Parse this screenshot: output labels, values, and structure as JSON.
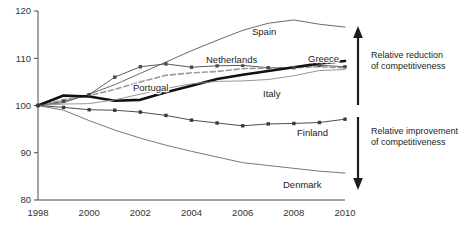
{
  "chart_data": {
    "type": "line",
    "title": "",
    "xlabel": "",
    "ylabel": "",
    "xlim": [
      1998,
      2010
    ],
    "ylim": [
      80,
      120
    ],
    "ytick_labels": [
      "80",
      "90",
      "100",
      "110",
      "120"
    ],
    "yticks": [
      80,
      90,
      100,
      110,
      120
    ],
    "xtick_labels": [
      "1998",
      "2000",
      "2002",
      "2004",
      "2006",
      "2008",
      "2010"
    ],
    "xticks": [
      1998,
      2000,
      2002,
      2004,
      2006,
      2008,
      2010
    ],
    "grid": false,
    "legend": "inline-labels",
    "x": [
      1998,
      1999,
      2000,
      2001,
      2002,
      2003,
      2004,
      2005,
      2006,
      2007,
      2008,
      2009,
      2010
    ],
    "series": [
      {
        "name": "Spain",
        "label": "Spain",
        "color": "#5a5a5a",
        "style": "thin-solid",
        "markers": false,
        "values": [
          100,
          100.6,
          102.4,
          104.4,
          106.8,
          109.2,
          111.6,
          113.8,
          115.9,
          117.4,
          118.1,
          117.2,
          116.6
        ]
      },
      {
        "name": "Netherlands",
        "label": "Netherlands",
        "color": "#4a4a4a",
        "style": "thin-solid",
        "markers": true,
        "values": [
          100,
          100.9,
          102.3,
          106.0,
          108.2,
          108.8,
          108.1,
          108.4,
          108.5,
          108.0,
          108.0,
          108.5,
          108.2
        ]
      },
      {
        "name": "Portugal",
        "label": "Portugal",
        "color": "#9a9a9a",
        "style": "dashed",
        "markers": false,
        "values": [
          100,
          101.2,
          102.1,
          103.4,
          105.0,
          106.4,
          106.9,
          107.2,
          107.8,
          107.9,
          108.0,
          108.2,
          108.0
        ]
      },
      {
        "name": "Greece",
        "label": "Greece",
        "color": "#111111",
        "style": "thick-solid",
        "markers": false,
        "values": [
          100,
          102.1,
          101.9,
          101.0,
          101.2,
          102.8,
          104.2,
          105.6,
          106.5,
          107.3,
          108.1,
          108.9,
          109.4
        ]
      },
      {
        "name": "Italy",
        "label": "Italy",
        "color": "#8a8a8a",
        "style": "thin-solid",
        "markers": false,
        "values": [
          100,
          100.3,
          100.4,
          101.2,
          102.4,
          103.6,
          104.6,
          105.1,
          105.2,
          105.5,
          106.3,
          107.4,
          107.6
        ]
      },
      {
        "name": "Finland",
        "label": "Finland",
        "color": "#3a3a3a",
        "style": "thin-solid",
        "markers": true,
        "values": [
          100,
          99.6,
          99.1,
          99.0,
          98.6,
          97.9,
          96.9,
          96.3,
          95.7,
          96.1,
          96.2,
          96.4,
          97.1
        ]
      },
      {
        "name": "Denmark",
        "label": "Denmark",
        "color": "#6a6a6a",
        "style": "thin-solid",
        "markers": false,
        "values": [
          100,
          99.0,
          96.8,
          94.8,
          93.1,
          91.6,
          90.3,
          89.1,
          87.9,
          87.3,
          86.7,
          86.1,
          85.7
        ]
      }
    ],
    "annotations": [
      {
        "name": "up-arrow-annotation",
        "text": "Relative reduction\nof competitiveness",
        "direction": "up"
      },
      {
        "name": "down-arrow-annotation",
        "text": "Relative improvement\nof competitiveness",
        "direction": "down"
      }
    ]
  },
  "series_label_positions": {
    "spain": {
      "x": 252,
      "y": 35
    },
    "netherlands": {
      "x": 206,
      "y": 63
    },
    "portugal": {
      "x": 133,
      "y": 91
    },
    "greece": {
      "x": 308,
      "y": 62
    },
    "italy": {
      "x": 263,
      "y": 97
    },
    "finland": {
      "x": 297,
      "y": 136
    },
    "denmark": {
      "x": 283,
      "y": 188
    }
  }
}
